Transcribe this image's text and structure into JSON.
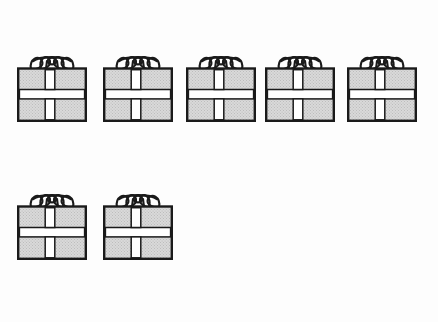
{
  "scene": {
    "title": "Gift boxes counting illustration",
    "background_color": "#fdfdfd",
    "total_items": 7,
    "item_name": "gift box"
  },
  "style": {
    "box_fill": "#d9d9d9",
    "box_outline": "#1a1a1a",
    "ribbon_color": "#ffffff",
    "bow_color": "#1a1a1a",
    "stipple_dot": "#bdbdbd"
  },
  "rows": [
    {
      "row_label": "top row",
      "count": 5,
      "top": 50,
      "items": [
        {
          "label": "gift box 1",
          "left": 17
        },
        {
          "label": "gift box 2",
          "left": 103
        },
        {
          "label": "gift box 3",
          "left": 186
        },
        {
          "label": "gift box 4",
          "left": 265
        },
        {
          "label": "gift box 5",
          "left": 347
        }
      ]
    },
    {
      "row_label": "bottom row",
      "count": 2,
      "top": 188,
      "items": [
        {
          "label": "gift box 6",
          "left": 17
        },
        {
          "label": "gift box 7",
          "left": 103
        }
      ]
    }
  ],
  "counts": {
    "top_row_text": "5",
    "bottom_row_text": "2",
    "total_text": "7"
  }
}
